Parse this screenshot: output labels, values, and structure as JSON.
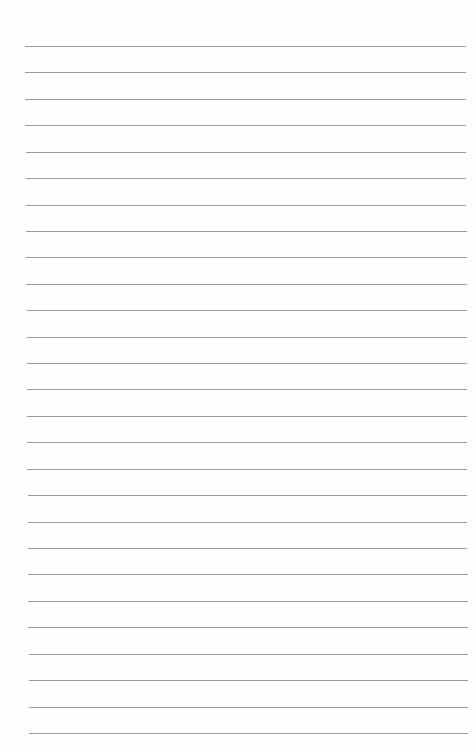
{
  "page": {
    "type": "lined-paper",
    "background": "#fefefe",
    "line_color": "#9a9a9a",
    "line_count": 27,
    "first_line_y": 46,
    "line_spacing": 26.42,
    "line_left_top": 25,
    "line_right_top": 466,
    "line_left_bottom": 29,
    "line_right_bottom": 468
  }
}
